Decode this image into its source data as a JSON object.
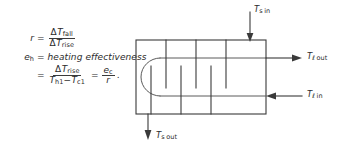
{
  "figure": {
    "caption_none": "",
    "equations": [
      {
        "id": "ratio",
        "lhs": "r",
        "eq": "=",
        "numerator_prefix": "Δ",
        "numerator_var": "T",
        "numerator_sub": "fall",
        "denominator_prefix": "Δ",
        "denominator_var": "T",
        "denominator_sub": "rise"
      },
      {
        "id": "heating-effectiveness-definition",
        "lhs": "e",
        "lhs_sub": "h",
        "eq": "=",
        "text": "heating effectiveness"
      },
      {
        "id": "heating-effectiveness-formula",
        "eq": "=",
        "numerator_prefix": "Δ",
        "numerator_var": "T",
        "numerator_sub": "rise",
        "denominator_var1": "T",
        "denominator_sub1": "h1",
        "denominator_minus": "−",
        "denominator_var2": "T",
        "denominator_sub2": "c1",
        "eq2": "=",
        "rhs_num_var": "e",
        "rhs_num_sub": "c",
        "rhs_den_var": "r",
        "trailing": "."
      }
    ],
    "diagram": {
      "name": "shell-and-tube-heat-exchanger-schematic",
      "shell_label": "shell",
      "labels": {
        "shell_in": {
          "var": "T",
          "sub": "s in",
          "sub_main": "s",
          "sub_tail": "in"
        },
        "shell_out": {
          "var": "T",
          "sub": "s out",
          "sub_main": "s",
          "sub_tail": "out"
        },
        "liquid_out": {
          "var": "T",
          "sub": "ℓ out",
          "sub_main": "ℓ",
          "sub_tail": "out"
        },
        "liquid_in": {
          "var": "T",
          "sub": "ℓ in",
          "sub_main": "ℓ",
          "sub_tail": "in"
        }
      },
      "colors": {
        "line": "#3a3a3a",
        "tube": "#5a5a5a",
        "background": "#ffffff"
      }
    }
  }
}
